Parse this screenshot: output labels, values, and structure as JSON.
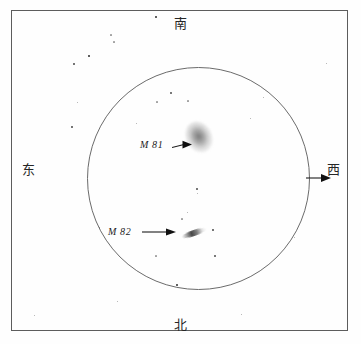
{
  "chart_data": {
    "type": "scatter",
    "title": "",
    "subtitle": "",
    "xlabel": "",
    "ylabel": "",
    "grid": false,
    "legend_position": "none",
    "field_circle": {
      "center_x": 186,
      "center_y": 167,
      "radius": 111
    },
    "objects": [
      {
        "name": "M 81",
        "label": "M 81",
        "kind": "galaxy",
        "shape": "oval-diffuse",
        "x": 187,
        "y": 126,
        "angle_deg": -28,
        "label_x": 128,
        "label_y": 128
      },
      {
        "name": "M 82",
        "label": "M 82",
        "kind": "galaxy",
        "shape": "edge-on-streak",
        "x": 182,
        "y": 222,
        "angle_deg": -19,
        "label_x": 96,
        "label_y": 215
      }
    ],
    "stars": [
      {
        "x": 155,
        "y": 16,
        "size": 2.2
      },
      {
        "x": 88,
        "y": 55,
        "size": 1.9
      },
      {
        "x": 113,
        "y": 41,
        "size": 1.2
      },
      {
        "x": 73,
        "y": 63,
        "size": 1.3
      },
      {
        "x": 110,
        "y": 34,
        "size": 1.1
      },
      {
        "x": 71,
        "y": 126,
        "size": 1.3
      },
      {
        "x": 76,
        "y": 101,
        "size": 1.0
      },
      {
        "x": 170,
        "y": 92,
        "size": 1.6
      },
      {
        "x": 187,
        "y": 100,
        "size": 1.2
      },
      {
        "x": 156,
        "y": 101,
        "size": 1.1
      },
      {
        "x": 135,
        "y": 122,
        "size": 1.0
      },
      {
        "x": 196,
        "y": 188,
        "size": 1.5
      },
      {
        "x": 186,
        "y": 211,
        "size": 1.0
      },
      {
        "x": 181,
        "y": 218,
        "size": 1.1
      },
      {
        "x": 212,
        "y": 229,
        "size": 1.3
      },
      {
        "x": 214,
        "y": 255,
        "size": 1.6
      },
      {
        "x": 155,
        "y": 255,
        "size": 1.1
      },
      {
        "x": 176,
        "y": 284,
        "size": 2.0
      },
      {
        "x": 196,
        "y": 192,
        "size": 1.0
      },
      {
        "x": 249,
        "y": 117,
        "size": 1.0
      },
      {
        "x": 293,
        "y": 236,
        "size": 1.0
      },
      {
        "x": 116,
        "y": 300,
        "size": 1.0
      },
      {
        "x": 325,
        "y": 62,
        "size": 1.0
      },
      {
        "x": 240,
        "y": 313,
        "size": 1.0
      },
      {
        "x": 98,
        "y": 226,
        "size": 1.0
      },
      {
        "x": 33,
        "y": 314,
        "size": 1.0
      },
      {
        "x": 262,
        "y": 96,
        "size": 1.0
      }
    ]
  },
  "directions": {
    "top": "南",
    "bottom": "北",
    "left": "东",
    "right": "西"
  },
  "icons": {
    "west_arrow": "arrow-right-icon",
    "m81_pointer": "arrow-pointer-icon",
    "m82_pointer": "arrow-pointer-icon"
  }
}
